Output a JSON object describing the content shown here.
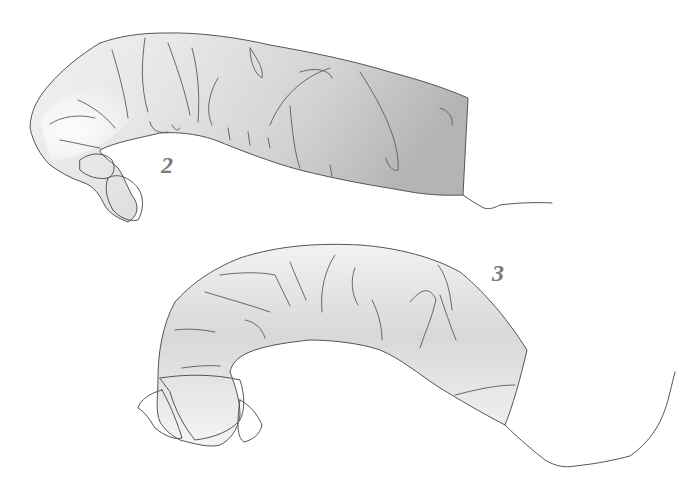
{
  "figure": {
    "specimens": [
      {
        "id": "specimen-2",
        "label": "2"
      },
      {
        "id": "specimen-3",
        "label": "3"
      }
    ],
    "colors": {
      "background": "#ffffff",
      "body_light": "#f4f4f4",
      "body_dark": "#b8b8b8",
      "line": "#555555",
      "label": "#7a7a7a"
    }
  }
}
